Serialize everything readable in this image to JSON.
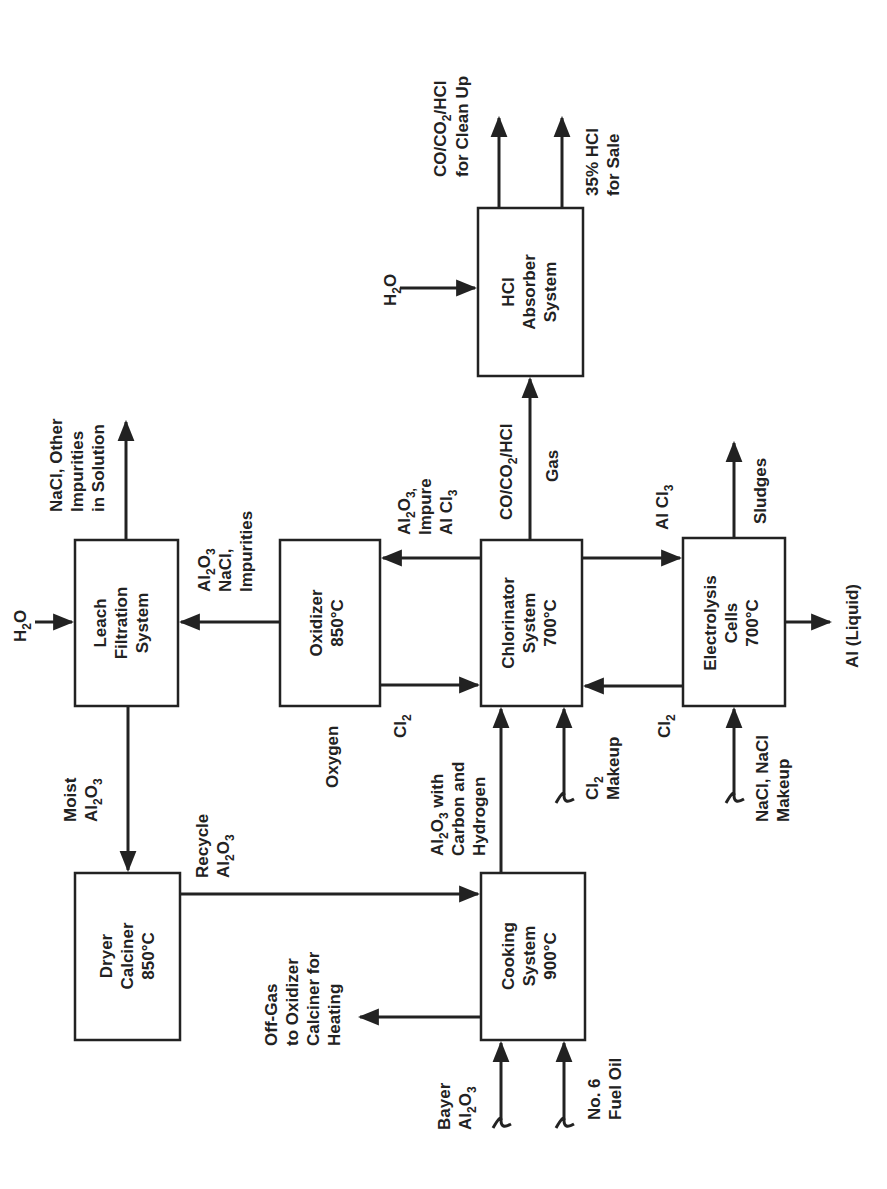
{
  "diagram": {
    "type": "process-flow",
    "orientation": "rotated-90-ccw",
    "colors": {
      "ink": "#222222",
      "background": "#ffffff"
    },
    "nodes": [
      {
        "id": "leach",
        "lines": [
          "Leach",
          "Filtration",
          "System"
        ]
      },
      {
        "id": "oxidizer",
        "lines": [
          "Oxidizer",
          "850°C"
        ]
      },
      {
        "id": "chlorinator",
        "lines": [
          "Chlorinator",
          "System",
          "700°C"
        ]
      },
      {
        "id": "electrolysis",
        "lines": [
          "Electrolysis",
          "Cells",
          "700°C"
        ]
      },
      {
        "id": "hcl_absorber",
        "lines": [
          "HCl",
          "Absorber",
          "System"
        ]
      },
      {
        "id": "dryer",
        "lines": [
          "Dryer",
          "Calciner",
          "850°C"
        ]
      },
      {
        "id": "cooking",
        "lines": [
          "Cooking",
          "System",
          "900°C"
        ]
      }
    ],
    "labels": {
      "h2o_leach": "H2O",
      "nacl_out": [
        "NaCl, Other",
        "Impurities",
        "in Solution"
      ],
      "al2o3_nacl": [
        "Al2O3",
        "NaCl,",
        "Impurities"
      ],
      "moist_al2o3": [
        "Moist",
        "Al2O3"
      ],
      "recycle_al2o3": [
        "Recycle",
        "Al2O3"
      ],
      "offgas": [
        "Off-Gas",
        "to Oxidizer",
        "Calciner for",
        "Heating"
      ],
      "bayer_al2o3": [
        "Bayer",
        "Al2O3"
      ],
      "fuel_oil": [
        "No. 6",
        "Fuel Oil"
      ],
      "oxygen": "Oxygen",
      "cl2_oxidizer": "Cl2",
      "al2o3_impure": [
        "Al2O3,",
        "Impure",
        "Al Cl3"
      ],
      "co_gas": [
        "CO/CO2/HCl",
        "Gas"
      ],
      "al2o3_carbon": [
        "Al2O3 with",
        "Carbon and",
        "Hydrogen"
      ],
      "cl2_makeup": [
        "Cl2",
        "Makeup"
      ],
      "alcl3": "Al Cl3",
      "cl2_electrolysis": "Cl2",
      "sludges": "Sludges",
      "al_liquid": "Al (Liquid)",
      "nacl_makeup": [
        "NaCl, NaCl",
        "Makeup"
      ],
      "h2o_absorber": "H2O",
      "co_cleanup": [
        "CO/CO2/HCl",
        "for Clean Up"
      ],
      "hcl_sale": [
        "35% HCl",
        "for Sale"
      ]
    },
    "edges": [
      {
        "from": "input:H2O",
        "to": "leach"
      },
      {
        "from": "leach",
        "to": "output:NaCl, Other Impurities in Solution"
      },
      {
        "from": "oxidizer",
        "to": "leach",
        "label": "Al2O3 NaCl, Impurities"
      },
      {
        "from": "leach",
        "to": "dryer",
        "label": "Moist Al2O3"
      },
      {
        "from": "dryer",
        "to": "cooking",
        "label": "Recycle Al2O3"
      },
      {
        "from": "cooking",
        "to": "output:Off-Gas to Oxidizer Calciner for Heating"
      },
      {
        "from": "input:Bayer Al2O3",
        "to": "cooking"
      },
      {
        "from": "input:No. 6 Fuel Oil",
        "to": "cooking"
      },
      {
        "from": "cooking",
        "to": "chlorinator",
        "label": "Al2O3 with Carbon and Hydrogen"
      },
      {
        "from": "oxidizer",
        "to": "chlorinator",
        "label": "Cl2"
      },
      {
        "from": "chlorinator",
        "to": "oxidizer",
        "label": "Al2O3, Impure Al Cl3"
      },
      {
        "from": "input:Cl2 Makeup",
        "to": "chlorinator"
      },
      {
        "from": "chlorinator",
        "to": "hcl_absorber",
        "label": "CO/CO2/HCl Gas"
      },
      {
        "from": "chlorinator",
        "to": "electrolysis",
        "label": "Al Cl3"
      },
      {
        "from": "electrolysis",
        "to": "chlorinator",
        "label": "Cl2"
      },
      {
        "from": "electrolysis",
        "to": "output:Sludges"
      },
      {
        "from": "electrolysis",
        "to": "output:Al (Liquid)"
      },
      {
        "from": "input:NaCl, NaCl Makeup",
        "to": "electrolysis"
      },
      {
        "from": "input:H2O",
        "to": "hcl_absorber"
      },
      {
        "from": "hcl_absorber",
        "to": "output:CO/CO2/HCl for Clean Up"
      },
      {
        "from": "hcl_absorber",
        "to": "output:35% HCl for Sale"
      }
    ]
  },
  "text": {
    "leach_1": "Leach",
    "leach_2": "Filtration",
    "leach_3": "System",
    "ox_1": "Oxidizer",
    "ox_2": "850°C",
    "chl_1": "Chlorinator",
    "chl_2": "System",
    "chl_3": "700°C",
    "el_1": "Electrolysis",
    "el_2": "Cells",
    "el_3": "700°C",
    "hcl_1": "HCl",
    "hcl_2": "Absorber",
    "hcl_3": "System",
    "dry_1": "Dryer",
    "dry_2": "Calciner",
    "dry_3": "850°C",
    "cook_1": "Cooking",
    "cook_2": "System",
    "cook_3": "900°C",
    "h2o_a": "H",
    "h2o_b": "2",
    "h2o_c": "O",
    "nacl_1": "NaCl, Other",
    "nacl_2": "Impurities",
    "nacl_3": "in Solution",
    "aln_1a": "Al",
    "aln_1b": "2",
    "aln_1c": "O",
    "aln_1d": "3",
    "aln_2": "NaCl,",
    "aln_3": "Impurities",
    "moist_1": "Moist",
    "moist_2a": "Al",
    "moist_2b": "2",
    "moist_2c": "O",
    "moist_2d": "3",
    "rec_1": "Recycle",
    "rec_2a": "Al",
    "rec_2b": "2",
    "rec_2c": "O",
    "rec_2d": "3",
    "off_1": "Off-Gas",
    "off_2": "to Oxidizer",
    "off_3": "Calciner for",
    "off_4": "Heating",
    "bay_1": "Bayer",
    "bay_2a": "Al",
    "bay_2b": "2",
    "bay_2c": "O",
    "bay_2d": "3",
    "fuel_1": "No. 6",
    "fuel_2": "Fuel Oil",
    "oxygen": "Oxygen",
    "cl2a": "Cl",
    "cl2b": "2",
    "imp_1a": "Al",
    "imp_1b": "2",
    "imp_1c": "O",
    "imp_1d": "3,",
    "imp_2": "Impure",
    "imp_3a": "Al Cl",
    "imp_3b": "3",
    "gas_1a": "CO/CO",
    "gas_1b": "2",
    "gas_1c": "/HCl",
    "gas_2": "Gas",
    "carb_1a": "Al",
    "carb_1b": "2",
    "carb_1c": "O",
    "carb_1d": "3",
    "carb_1e": " with",
    "carb_2": "Carbon and",
    "carb_3": "Hydrogen",
    "mk_1a": "Cl",
    "mk_1b": "2",
    "mk_2": "Makeup",
    "alcl_a": "Al Cl",
    "alcl_b": "3",
    "cl2e_a": "Cl",
    "cl2e_b": "2",
    "sludges": "Sludges",
    "al_liquid": "Al (Liquid)",
    "nam_1": "NaCl, NaCl",
    "nam_2": "Makeup",
    "clean_1a": "CO/CO",
    "clean_1b": "2",
    "clean_1c": "/HCl",
    "clean_2": "for Clean Up",
    "sale_1": "35% HCl",
    "sale_2": "for Sale"
  }
}
